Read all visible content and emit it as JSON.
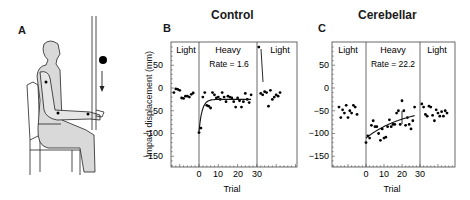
{
  "figure": {
    "panels": {
      "A": {
        "letter": "A"
      },
      "B": {
        "letter": "B",
        "title": "Control"
      },
      "C": {
        "letter": "C",
        "title": "Cerebellar"
      }
    },
    "y_label": "Impact displacement (mm)",
    "x_label": "Trial",
    "y_ticks": [
      "50",
      "0",
      "−50",
      "−100",
      "−150"
    ],
    "x_ticks": [
      "0",
      "10",
      "20",
      "30"
    ],
    "segment_labels": {
      "light1": "Light",
      "heavy": "Heavy",
      "light2": "Light"
    },
    "rate_B": "Rate = 1.6",
    "rate_C": "Rate = 22.2"
  },
  "chart_data": [
    {
      "type": "scatter",
      "title": "Control",
      "panel": "B",
      "xlabel": "Trial",
      "ylabel": "Impact displacement (mm)",
      "ylim": [
        -175,
        95
      ],
      "yticks": [
        50,
        0,
        -50,
        -100,
        -150
      ],
      "xticks": [
        0,
        10,
        20,
        30
      ],
      "grid": false,
      "values_note": "Approximate: per-trial values estimated visually from the rendered figure (likely error roughly ±5–10 mm; segment point counts may be off by 1–2). Axis ticks, labels and rate annotations are read exactly.",
      "segments": [
        {
          "name": "Light (pre)",
          "x": [
            -13,
            -12,
            -11,
            -10,
            -9,
            -8,
            -7,
            -6,
            -5,
            -4,
            -3
          ],
          "y": [
            -10,
            -2,
            -3,
            -5,
            -22,
            -23,
            -18,
            -18,
            -20,
            -14,
            -11
          ]
        },
        {
          "name": "Heavy",
          "annotation": "Rate = 1.6",
          "x": [
            0,
            1,
            2,
            3,
            4,
            5,
            6,
            7,
            8,
            9,
            10,
            11,
            12,
            13,
            14,
            15,
            16,
            17,
            18,
            19,
            20,
            21,
            22,
            23,
            24,
            25,
            26,
            27
          ],
          "y": [
            -98,
            -88,
            -20,
            -10,
            -38,
            -40,
            -44,
            -10,
            -15,
            -22,
            -20,
            -25,
            -10,
            -20,
            -30,
            -18,
            -20,
            -22,
            -30,
            -42,
            -22,
            -28,
            -42,
            -30,
            -12,
            -25,
            -32,
            -15
          ],
          "fit": "exponential",
          "fit_asymptote": -25
        },
        {
          "name": "Light (post)",
          "x": [
            31,
            32,
            33,
            34,
            35,
            36,
            37,
            38,
            39,
            40,
            41,
            42
          ],
          "y": [
            90,
            -12,
            -15,
            -8,
            -10,
            -40,
            -5,
            -25,
            -20,
            -15,
            -18,
            -10
          ]
        }
      ]
    },
    {
      "type": "scatter",
      "title": "Cerebellar",
      "panel": "C",
      "xlabel": "Trial",
      "ylabel": "Impact displacement (mm)",
      "ylim": [
        -175,
        95
      ],
      "yticks": [
        50,
        0,
        -50,
        -100,
        -150
      ],
      "xticks": [
        0,
        10,
        20,
        30
      ],
      "grid": false,
      "values_note": "Approximate: per-trial values estimated visually from the rendered figure (likely error roughly ±5–10 mm; segment point counts may be off by 1–2). Axis ticks, labels and rate annotations are read exactly.",
      "segments": [
        {
          "name": "Light (pre)",
          "x": [
            -15,
            -14,
            -13,
            -12,
            -11,
            -10,
            -9,
            -8,
            -7,
            -6,
            -5
          ],
          "y": [
            -42,
            -65,
            -48,
            -55,
            -38,
            -65,
            -50,
            -55,
            -38,
            -42,
            -58
          ]
        },
        {
          "name": "Heavy",
          "annotation": "Rate = 22.2",
          "x": [
            0,
            1,
            2,
            3,
            4,
            5,
            6,
            7,
            8,
            9,
            10,
            11,
            12,
            13,
            14,
            15,
            16,
            17,
            18,
            19,
            20,
            21,
            22,
            23,
            24,
            25,
            26,
            27
          ],
          "y": [
            -120,
            -105,
            -110,
            -82,
            -72,
            -85,
            -85,
            -100,
            -115,
            -90,
            -110,
            -108,
            -85,
            -70,
            -85,
            -80,
            -80,
            -55,
            -50,
            -80,
            -28,
            -50,
            -82,
            -65,
            -80,
            -90,
            -72,
            -42
          ],
          "fit": "exponential",
          "fit_start": -110,
          "fit_end": -60
        },
        {
          "name": "Light (post)",
          "x": [
            31,
            32,
            33,
            34,
            35,
            36,
            37,
            38,
            39,
            40,
            41,
            42,
            43,
            44,
            45
          ],
          "y": [
            -35,
            -42,
            -58,
            -62,
            -40,
            -42,
            -60,
            -72,
            -48,
            -55,
            -62,
            -52,
            -62,
            -50,
            -55
          ]
        }
      ]
    }
  ]
}
